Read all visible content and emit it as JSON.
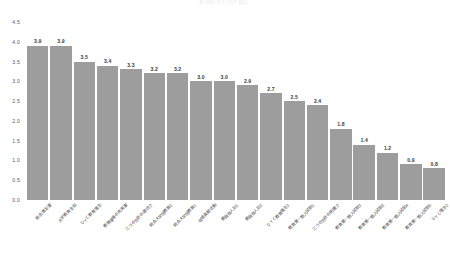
{
  "chart_data": {
    "type": "bar",
    "title": "各項目の平均評価点",
    "xlabel": "",
    "ylabel": "",
    "ylim": [
      0.0,
      4.5
    ],
    "yticks": [
      "4.5",
      "4.0",
      "3.5",
      "3.0",
      "2.5",
      "2.0",
      "1.5",
      "1.0",
      "0.5",
      "0.0"
    ],
    "grid": false,
    "legend": "none",
    "bar_color": "#9d9d9d",
    "value_label_color": "#3a3a3c",
    "axis_label_color": "#59595b",
    "background": "#ffffff",
    "categories": [
      "総合満足度",
      "大学教育全般",
      "ＤＹＣ教育理念",
      "教育環境の充実度",
      "三つの方針の適切さ",
      "総合大学院教育2",
      "総合大学院教育1",
      "地域貢献活動",
      "教員個人別1",
      "教員個人別2",
      "ＤＹＣ教育理念2",
      "教育第一期入試制1",
      "三つの方針の明確さ",
      "教育第一期入試制2",
      "教育第一期入試制3",
      "教育第一期入試制4",
      "教育第一期入試制5",
      "ＤＹＣ理念2"
    ],
    "values": [
      3.9,
      3.9,
      3.5,
      3.4,
      3.3,
      3.2,
      3.2,
      3.0,
      3.0,
      2.9,
      2.7,
      2.5,
      2.4,
      1.8,
      1.4,
      1.2,
      0.9,
      0.8
    ]
  }
}
